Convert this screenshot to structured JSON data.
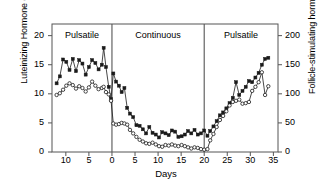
{
  "chart_data": {
    "type": "line",
    "title": "",
    "xlabel": "Days",
    "ylabel": "Luteinizing Hormone (ng/mL)",
    "y2label": "Follicle-stimulating hormone (ng/mL)",
    "xlim": [
      -13,
      36
    ],
    "ylim": [
      0,
      22
    ],
    "y2lim": [
      0,
      220
    ],
    "grid": false,
    "legend": "none",
    "xticks": [
      -10,
      -5,
      0,
      5,
      10,
      15,
      20,
      25,
      30,
      35
    ],
    "xticklabels": [
      "10",
      "5",
      "0",
      "5",
      "10",
      "15",
      "20",
      "25",
      "30",
      "35"
    ],
    "yticks": [
      0,
      5,
      10,
      15,
      20
    ],
    "yticklabels": [
      "0",
      "5",
      "10",
      "15",
      "20"
    ],
    "y2ticks": [
      0,
      50,
      100,
      150,
      200
    ],
    "y2ticklabels": [
      "0",
      "50",
      "100",
      "150",
      "200"
    ],
    "annotations": [
      {
        "label": "Pulsatile",
        "x_center": -6.5
      },
      {
        "label": "Continuous",
        "x_center": 10.0
      },
      {
        "label": "Pulsatile",
        "x_center": 28.0
      }
    ],
    "dividers": [
      0,
      20
    ],
    "series": [
      {
        "name": "Luteinizing Hormone",
        "marker": "filled-square",
        "axis": "left",
        "color": "#1a1a1a",
        "points": [
          [
            -12.0,
            11.8
          ],
          [
            -11.3,
            13.0
          ],
          [
            -10.6,
            15.9
          ],
          [
            -9.9,
            15.5
          ],
          [
            -9.2,
            14.1
          ],
          [
            -8.5,
            16.0
          ],
          [
            -7.8,
            13.9
          ],
          [
            -7.1,
            15.8
          ],
          [
            -6.4,
            15.2
          ],
          [
            -5.7,
            13.3
          ],
          [
            -5.0,
            14.6
          ],
          [
            -4.3,
            15.8
          ],
          [
            -3.6,
            15.3
          ],
          [
            -2.9,
            14.2
          ],
          [
            -2.2,
            15.0
          ],
          [
            -1.8,
            17.9
          ],
          [
            -1.3,
            14.6
          ],
          [
            -0.7,
            11.2
          ],
          [
            -0.2,
            9.1
          ],
          [
            0.3,
            13.5
          ],
          [
            0.9,
            12.1
          ],
          [
            1.5,
            11.4
          ],
          [
            2.1,
            10.3
          ],
          [
            2.7,
            11.0
          ],
          [
            3.3,
            7.6
          ],
          [
            3.9,
            6.6
          ],
          [
            4.6,
            6.0
          ],
          [
            5.3,
            4.6
          ],
          [
            6.0,
            4.5
          ],
          [
            6.7,
            3.9
          ],
          [
            7.4,
            3.2
          ],
          [
            8.1,
            4.3
          ],
          [
            8.8,
            3.3
          ],
          [
            9.5,
            3.0
          ],
          [
            10.2,
            2.5
          ],
          [
            10.9,
            3.4
          ],
          [
            11.6,
            3.2
          ],
          [
            12.3,
            2.9
          ],
          [
            13.0,
            3.7
          ],
          [
            13.7,
            3.5
          ],
          [
            14.4,
            2.6
          ],
          [
            15.1,
            2.7
          ],
          [
            15.8,
            3.0
          ],
          [
            16.5,
            3.6
          ],
          [
            17.2,
            3.2
          ],
          [
            17.9,
            3.8
          ],
          [
            18.6,
            3.0
          ],
          [
            19.3,
            3.2
          ],
          [
            20.0,
            3.7
          ],
          [
            20.7,
            2.8
          ],
          [
            21.3,
            3.6
          ],
          [
            22.0,
            4.4
          ],
          [
            22.7,
            5.3
          ],
          [
            23.4,
            6.3
          ],
          [
            24.1,
            6.8
          ],
          [
            24.8,
            7.5
          ],
          [
            25.5,
            8.4
          ],
          [
            26.2,
            9.3
          ],
          [
            26.9,
            12.0
          ],
          [
            27.6,
            9.8
          ],
          [
            28.3,
            10.5
          ],
          [
            29.0,
            11.2
          ],
          [
            29.7,
            12.2
          ],
          [
            30.4,
            12.0
          ],
          [
            31.1,
            12.8
          ],
          [
            31.8,
            13.6
          ],
          [
            32.5,
            15.0
          ],
          [
            33.2,
            16.0
          ],
          [
            33.9,
            16.2
          ]
        ]
      },
      {
        "name": "Follicle-stimulating hormone",
        "marker": "open-circle",
        "axis": "right",
        "color": "#1a1a1a",
        "points": [
          [
            -12.0,
            98
          ],
          [
            -11.3,
            101
          ],
          [
            -10.6,
            107
          ],
          [
            -9.9,
            114
          ],
          [
            -9.2,
            118
          ],
          [
            -8.5,
            115
          ],
          [
            -7.8,
            109
          ],
          [
            -7.1,
            113
          ],
          [
            -6.4,
            110
          ],
          [
            -5.7,
            104
          ],
          [
            -5.0,
            111
          ],
          [
            -4.3,
            121
          ],
          [
            -3.6,
            114
          ],
          [
            -2.9,
            108
          ],
          [
            -2.2,
            110
          ],
          [
            -1.8,
            112
          ],
          [
            -1.3,
            103
          ],
          [
            -0.7,
            99
          ],
          [
            -0.2,
            88
          ],
          [
            0.3,
            49
          ],
          [
            0.9,
            47
          ],
          [
            1.5,
            48
          ],
          [
            2.1,
            50
          ],
          [
            2.7,
            49
          ],
          [
            3.3,
            47
          ],
          [
            3.9,
            38
          ],
          [
            4.6,
            32
          ],
          [
            5.3,
            26
          ],
          [
            6.0,
            21
          ],
          [
            6.7,
            18
          ],
          [
            7.4,
            15
          ],
          [
            8.1,
            14
          ],
          [
            8.8,
            16
          ],
          [
            9.5,
            13
          ],
          [
            10.2,
            10
          ],
          [
            10.9,
            9
          ],
          [
            11.6,
            12
          ],
          [
            12.3,
            11
          ],
          [
            13.0,
            13
          ],
          [
            13.7,
            11
          ],
          [
            14.4,
            10
          ],
          [
            15.1,
            12
          ],
          [
            15.8,
            10
          ],
          [
            16.5,
            8
          ],
          [
            17.2,
            6
          ],
          [
            17.9,
            8
          ],
          [
            18.6,
            7
          ],
          [
            19.3,
            5
          ],
          [
            20.0,
            4
          ],
          [
            20.7,
            5
          ],
          [
            21.3,
            20
          ],
          [
            22.0,
            31
          ],
          [
            22.7,
            43
          ],
          [
            23.4,
            55
          ],
          [
            24.1,
            62
          ],
          [
            24.8,
            70
          ],
          [
            25.5,
            80
          ],
          [
            26.2,
            86
          ],
          [
            26.9,
            88
          ],
          [
            27.6,
            90
          ],
          [
            28.3,
            83
          ],
          [
            29.0,
            84
          ],
          [
            29.7,
            86
          ],
          [
            30.4,
            105
          ],
          [
            31.1,
            112
          ],
          [
            31.8,
            120
          ],
          [
            32.5,
            137
          ],
          [
            33.2,
            98
          ],
          [
            33.9,
            113
          ]
        ]
      }
    ]
  }
}
